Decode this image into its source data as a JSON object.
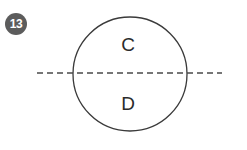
{
  "figure": {
    "question_number": "13",
    "background_color": "#ffffff",
    "badge": {
      "label": "13",
      "fill_color": "#5c5c5c",
      "text_color": "#ffffff",
      "shape": "circle",
      "center_x": 16,
      "center_y": 24,
      "radius": 11
    },
    "circle": {
      "name": "outline-circle",
      "center_x": 130,
      "center_y": 74,
      "radius": 57,
      "stroke_color": "#3a3a3a",
      "stroke_width": 1.3,
      "fill": "none"
    },
    "dashed_line": {
      "name": "horizontal-dashed-line",
      "orientation": "horizontal",
      "x_start": 37,
      "x_end": 222,
      "y": 73,
      "stroke_color": "#4a4a4a",
      "stroke_width": 1.3,
      "dash_length": 6,
      "gap_length": 4
    },
    "labels": [
      {
        "name": "region-label-c",
        "text": "C",
        "x": 128,
        "y": 48,
        "region": "upper-half",
        "color": "#2b2b2b"
      },
      {
        "name": "region-label-d",
        "text": "D",
        "x": 128,
        "y": 107,
        "region": "lower-half",
        "color": "#2b2b2b"
      }
    ]
  }
}
